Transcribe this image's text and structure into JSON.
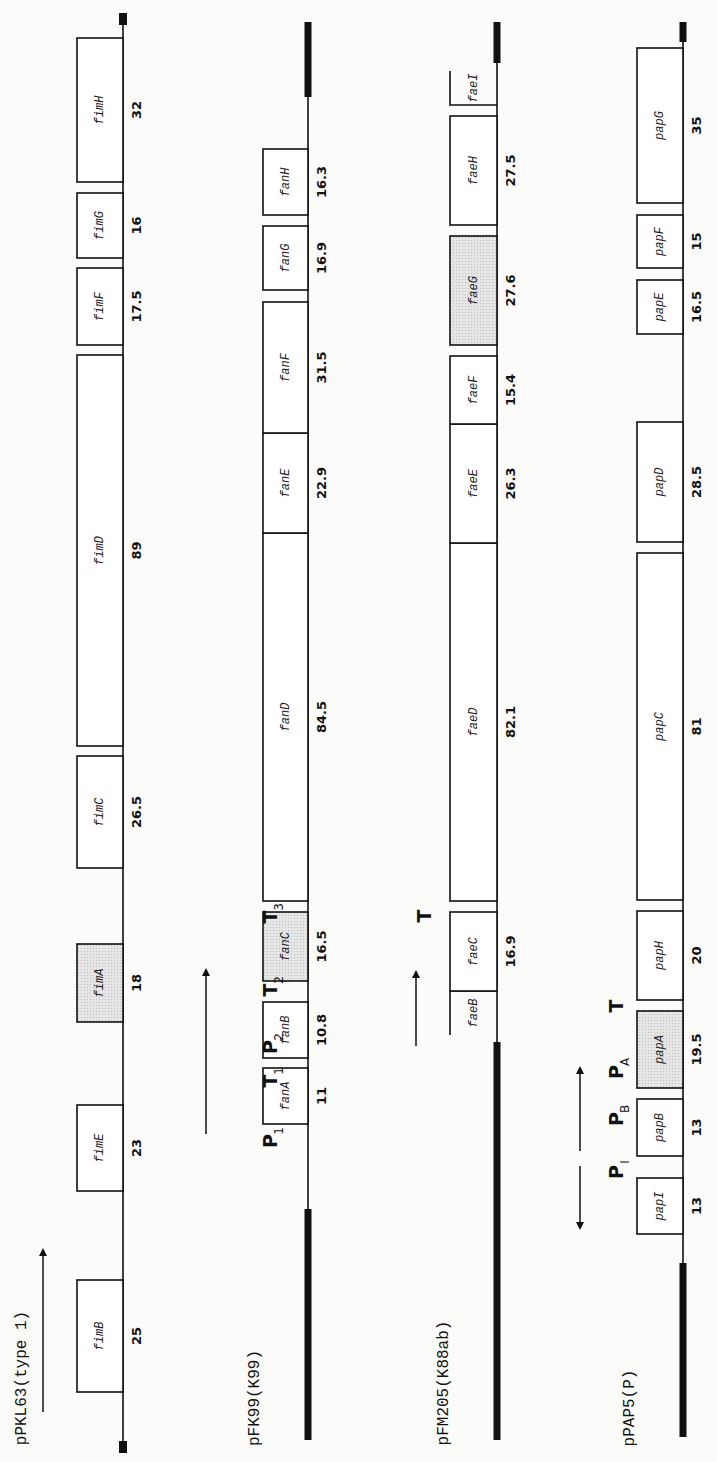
{
  "figure": {
    "orientation": "rotated-90-ccw",
    "colors": {
      "background": "#fbfbfa",
      "line": "#111111",
      "shaded_gene": "#e2e2e2",
      "gene_fill": "#ffffff"
    },
    "operons": [
      {
        "id": "pPKL63",
        "title": "pPKL63(type 1)",
        "axis_x": 123,
        "box_left_x": 77,
        "vector_start": {
          "y": 1441,
          "len": 12
        },
        "vector_end": {
          "y": 25,
          "len": 12
        },
        "genes": [
          {
            "name": "fimB",
            "size": "25",
            "y_top": 1280,
            "y_bot": 1392,
            "shaded": false
          },
          {
            "name": "fimE",
            "size": "23",
            "y_top": 1105,
            "y_bot": 1191,
            "shaded": false
          },
          {
            "name": "fimA",
            "size": "18",
            "y_top": 944,
            "y_bot": 1022,
            "shaded": true
          },
          {
            "name": "fimC",
            "size": "26.5",
            "y_top": 756,
            "y_bot": 868,
            "shaded": false
          },
          {
            "name": "fimD",
            "size": "89",
            "y_top": 355,
            "y_bot": 746,
            "shaded": false
          },
          {
            "name": "fimF",
            "size": "17.5",
            "y_top": 268,
            "y_bot": 345,
            "shaded": false
          },
          {
            "name": "fimG",
            "size": "16",
            "y_top": 193,
            "y_bot": 258,
            "shaded": false
          },
          {
            "name": "fimH",
            "size": "32",
            "y_top": 38,
            "y_bot": 182,
            "shaded": false
          }
        ],
        "arrows": [
          {
            "x": 43,
            "y_from": 1412,
            "y_to": 1250,
            "direction": "up"
          }
        ],
        "promoters": []
      },
      {
        "id": "pFK99",
        "title": "pFK99(K99)",
        "axis_x": 308,
        "box_left_x": 263,
        "vector_start": {
          "y_from": 1209,
          "y_to": 1440,
          "thick": true
        },
        "vector_end": {
          "y_from": 22,
          "y_to": 97,
          "thick": true
        },
        "genes": [
          {
            "name": "fanA",
            "size": "11",
            "y_top": 1068,
            "y_bot": 1124,
            "shaded": false
          },
          {
            "name": "fanB",
            "size": "10.8",
            "y_top": 1002,
            "y_bot": 1058,
            "shaded": false
          },
          {
            "name": "fanC",
            "size": "16.5",
            "y_top": 912,
            "y_bot": 981,
            "shaded": true
          },
          {
            "name": "fanD",
            "size": "84.5",
            "y_top": 533,
            "y_bot": 901,
            "shaded": false
          },
          {
            "name": "fanE",
            "size": "22.9",
            "y_top": 433,
            "y_bot": 533,
            "shaded": false
          },
          {
            "name": "fanF",
            "size": "31.5",
            "y_top": 302,
            "y_bot": 433,
            "shaded": false
          },
          {
            "name": "fanG",
            "size": "16.9",
            "y_top": 226,
            "y_bot": 290,
            "shaded": false
          },
          {
            "name": "fanH",
            "size": "16.3",
            "y_top": 149,
            "y_bot": 215,
            "shaded": false
          }
        ],
        "arrows": [
          {
            "x": 206,
            "y_from": 1134,
            "y_to": 970,
            "direction": "up"
          }
        ],
        "promoters": [
          {
            "main": "P",
            "sub": "1",
            "x": 270,
            "y": 1141
          },
          {
            "main": "T",
            "sub": "1",
            "x": 270,
            "y": 1081
          },
          {
            "main": "P",
            "sub": "2",
            "x": 270,
            "y": 1047
          },
          {
            "main": "T",
            "sub": "2",
            "x": 270,
            "y": 990
          },
          {
            "main": "T",
            "sub": "3",
            "x": 270,
            "y": 917
          }
        ]
      },
      {
        "id": "pFM205",
        "title": "pFM205(K88ab)",
        "axis_x": 497,
        "box_left_x": 450,
        "vector_start": {
          "y_from": 1042,
          "y_to": 1440,
          "thick": true
        },
        "vector_end": {
          "y_from": 22,
          "y_to": 63,
          "thick": true
        },
        "genes": [
          {
            "name": "faeB",
            "size": "",
            "y_top": 991,
            "y_bot": 1035,
            "shaded": false,
            "open": "bottom"
          },
          {
            "name": "faeC",
            "size": "16.9",
            "y_top": 912,
            "y_bot": 991,
            "shaded": false
          },
          {
            "name": "faeD",
            "size": "82.1",
            "y_top": 543,
            "y_bot": 901,
            "shaded": false
          },
          {
            "name": "faeE",
            "size": "26.3",
            "y_top": 424,
            "y_bot": 543,
            "shaded": false
          },
          {
            "name": "faeF",
            "size": "15.4",
            "y_top": 356,
            "y_bot": 424,
            "shaded": false
          },
          {
            "name": "faeG",
            "size": "27.6",
            "y_top": 236,
            "y_bot": 345,
            "shaded": true
          },
          {
            "name": "faeH",
            "size": "27.5",
            "y_top": 116,
            "y_bot": 225,
            "shaded": false
          },
          {
            "name": "faeI",
            "size": "",
            "y_top": 71,
            "y_bot": 105,
            "shaded": false,
            "open": "top"
          }
        ],
        "arrows": [
          {
            "x": 416,
            "y_from": 1046,
            "y_to": 972,
            "direction": "up"
          }
        ],
        "promoters": [
          {
            "main": "T",
            "sub": "",
            "x": 424,
            "y": 916
          }
        ]
      },
      {
        "id": "pPAP5",
        "title": "pPAP5(P)",
        "axis_x": 683,
        "box_left_x": 637,
        "vector_start": {
          "y_from": 1263,
          "y_to": 1437,
          "thick": true
        },
        "vector_end": {
          "y_from": 22,
          "y_to": 42,
          "thick": true
        },
        "genes": [
          {
            "name": "papI",
            "size": "13",
            "y_top": 1178,
            "y_bot": 1234,
            "shaded": false
          },
          {
            "name": "papB",
            "size": "13",
            "y_top": 1099,
            "y_bot": 1156,
            "shaded": false
          },
          {
            "name": "papA",
            "size": "19.5",
            "y_top": 1011,
            "y_bot": 1088,
            "shaded": true
          },
          {
            "name": "papH",
            "size": "20",
            "y_top": 911,
            "y_bot": 1000,
            "shaded": false
          },
          {
            "name": "papC",
            "size": "81",
            "y_top": 553,
            "y_bot": 900,
            "shaded": false
          },
          {
            "name": "papD",
            "size": "28.5",
            "y_top": 422,
            "y_bot": 542,
            "shaded": false
          },
          {
            "name": "papE",
            "size": "16.5",
            "y_top": 280,
            "y_bot": 334,
            "shaded": false
          },
          {
            "name": "papF",
            "size": "15",
            "y_top": 215,
            "y_bot": 268,
            "shaded": false
          },
          {
            "name": "papG",
            "size": "35",
            "y_top": 48,
            "y_bot": 203,
            "shaded": false
          }
        ],
        "arrows": [
          {
            "x": 580,
            "y_from": 1166,
            "y_to": 1228,
            "direction": "down"
          },
          {
            "x": 580,
            "y_from": 1151,
            "y_to": 1068,
            "direction": "up"
          }
        ],
        "promoters": [
          {
            "main": "P",
            "sub": "I",
            "x": 616,
            "y": 1172
          },
          {
            "main": "P",
            "sub": "B",
            "x": 616,
            "y": 1119
          },
          {
            "main": "P",
            "sub": "A",
            "x": 616,
            "y": 1072
          },
          {
            "main": "T",
            "sub": "",
            "x": 616,
            "y": 1006
          }
        ]
      }
    ]
  }
}
